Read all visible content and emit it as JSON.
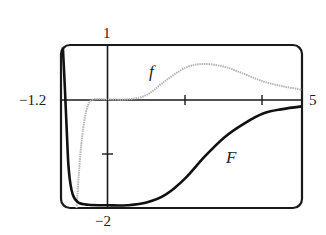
{
  "chart_data": {
    "type": "line",
    "title": "",
    "xlabel": "",
    "ylabel": "",
    "xlim": [
      -1.2,
      5
    ],
    "ylim": [
      -2,
      1
    ],
    "x_ticks": [
      2,
      4
    ],
    "y_ticks": [
      -1
    ],
    "range_labels": {
      "x_min": "−1.2",
      "x_max": "5",
      "y_max": "1",
      "y_min": "−2"
    },
    "grid": false,
    "legend": "inline labels",
    "series": [
      {
        "name": "f",
        "color": "#aaaaaa",
        "style": "dotted-gray",
        "points": [
          [
            -0.8,
            -2.0
          ],
          [
            -0.7,
            -1.0
          ],
          [
            -0.6,
            -0.4
          ],
          [
            -0.5,
            -0.1
          ],
          [
            -0.35,
            0.0
          ],
          [
            0.0,
            0.0
          ],
          [
            0.5,
            0.0
          ],
          [
            1.0,
            0.08
          ],
          [
            1.5,
            0.35
          ],
          [
            2.0,
            0.58
          ],
          [
            2.45,
            0.65
          ],
          [
            3.0,
            0.6
          ],
          [
            3.5,
            0.47
          ],
          [
            4.0,
            0.33
          ],
          [
            4.5,
            0.24
          ],
          [
            5.0,
            0.18
          ]
        ]
      },
      {
        "name": "F",
        "color": "#111111",
        "style": "solid-bold",
        "points": [
          [
            -1.15,
            0.95
          ],
          [
            -1.1,
            0.2
          ],
          [
            -1.05,
            -0.6
          ],
          [
            -1.0,
            -1.3
          ],
          [
            -0.9,
            -1.75
          ],
          [
            -0.75,
            -1.9
          ],
          [
            -0.5,
            -1.94
          ],
          [
            0.0,
            -1.95
          ],
          [
            0.5,
            -1.95
          ],
          [
            1.0,
            -1.9
          ],
          [
            1.5,
            -1.75
          ],
          [
            2.0,
            -1.45
          ],
          [
            2.5,
            -1.05
          ],
          [
            3.0,
            -0.7
          ],
          [
            3.5,
            -0.45
          ],
          [
            4.0,
            -0.26
          ],
          [
            4.5,
            -0.18
          ],
          [
            5.0,
            -0.13
          ]
        ]
      }
    ],
    "annotations": [
      {
        "text": "f",
        "x": 1.1,
        "y": 0.5
      },
      {
        "text": "F",
        "x": 3.2,
        "y": -1.05
      }
    ]
  },
  "labels": {
    "y_max": "1",
    "y_min": "−2",
    "x_min": "−1.2",
    "x_max": "5",
    "f": "f",
    "F": "F"
  }
}
